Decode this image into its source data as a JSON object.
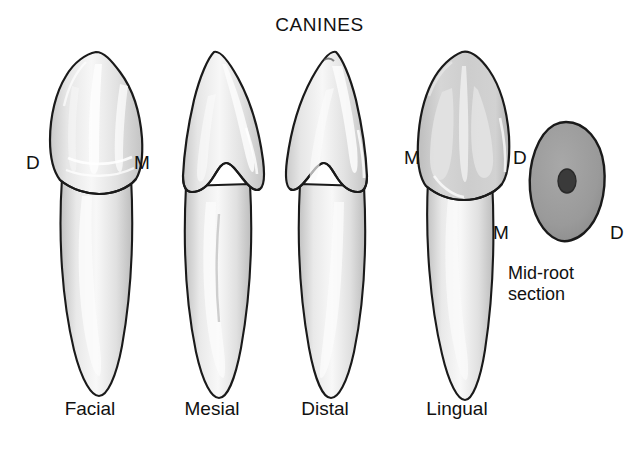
{
  "figure": {
    "title": "CANINES",
    "background_color": "#ffffff",
    "ink_color": "#111111",
    "outline_color": "#1a1a1a",
    "enamel_fill": "#e8e8e8",
    "enamel_highlight": "#fafafa",
    "dentin_fill": "#d8d8d8",
    "lingual_shade": "#c6c6c6",
    "section_fill": "#9a9a9a",
    "canal_fill": "#3a3a3a"
  },
  "views": [
    {
      "id": "facial",
      "label": "Facial",
      "left_letter": "D",
      "right_letter": "M"
    },
    {
      "id": "mesial",
      "label": "Mesial",
      "left_letter": "",
      "right_letter": ""
    },
    {
      "id": "distal",
      "label": "Distal",
      "left_letter": "",
      "right_letter": ""
    },
    {
      "id": "lingual",
      "label": "Lingual",
      "left_letter": "M",
      "right_letter": "D"
    }
  ],
  "section": {
    "caption_line1": "Mid-root",
    "caption_line2": "section",
    "left_letter": "M",
    "right_letter": "D"
  }
}
